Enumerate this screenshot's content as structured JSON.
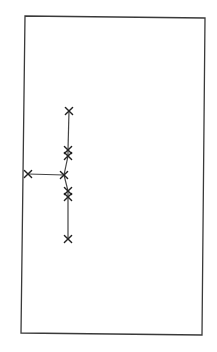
{
  "diagram": {
    "title": "",
    "colors": {
      "frame": "#3a3a3a",
      "edge": "#444444",
      "node": "#222222",
      "background": "#ffffff"
    },
    "node_icon": "cross-x-icon",
    "nodes": [
      {
        "id": "n1",
        "label": ""
      },
      {
        "id": "n2",
        "label": ""
      },
      {
        "id": "n3",
        "label": ""
      },
      {
        "id": "n4",
        "label": ""
      },
      {
        "id": "n5",
        "label": ""
      },
      {
        "id": "n6",
        "label": ""
      },
      {
        "id": "n7",
        "label": ""
      },
      {
        "id": "n8",
        "label": ""
      }
    ],
    "edges": [
      {
        "from": "n1",
        "to": "n2"
      },
      {
        "from": "n2",
        "to": "n3"
      },
      {
        "from": "n3",
        "to": "n4"
      },
      {
        "from": "n4",
        "to": "n5"
      },
      {
        "from": "n5",
        "to": "n6"
      },
      {
        "from": "n6",
        "to": "n7"
      },
      {
        "from": "n4",
        "to": "n8"
      }
    ]
  }
}
